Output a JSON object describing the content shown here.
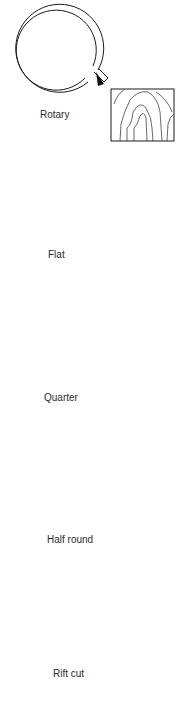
{
  "figure": {
    "sections": [
      {
        "id": "rotary",
        "label": "Rotary"
      },
      {
        "id": "flat",
        "label": "Flat"
      },
      {
        "id": "quarter",
        "label": "Quarter"
      },
      {
        "id": "half-round",
        "label": "Half round"
      },
      {
        "id": "rift-cut",
        "label": "Rift cut"
      }
    ]
  },
  "colors": {
    "line": "#1a1a1a",
    "background": "#ffffff",
    "axle_left": "#c060a0",
    "axle_right": "#50c070",
    "halfround_tint": "#bfe8ec",
    "halfround_accent": "#d04060"
  }
}
